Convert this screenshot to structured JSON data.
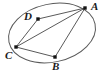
{
  "figure": {
    "kind": "geometry-diagram",
    "background_color": "#ffffff",
    "stroke_color": "#5a5a5a",
    "point_color": "#141414",
    "label_color": "#1a1a1a",
    "canvas": {
      "width": 104,
      "height": 76
    },
    "ellipse": {
      "name": "outer-ellipse",
      "cx": 52,
      "cy": 33,
      "rx": 44,
      "ry": 29,
      "rotation_deg": -12,
      "stroke_width": 1
    },
    "points": [
      {
        "id": "A",
        "label": "A",
        "x": 85,
        "y": 8,
        "label_x": 91,
        "label_y": 1,
        "on_curve": true,
        "dot": true
      },
      {
        "id": "B",
        "label": "B",
        "x": 55,
        "y": 57,
        "label_x": 52,
        "label_y": 61,
        "on_curve": true,
        "dot": true
      },
      {
        "id": "C",
        "label": "C",
        "x": 16,
        "y": 47,
        "label_x": 5,
        "label_y": 50,
        "on_curve": true,
        "dot": true
      },
      {
        "id": "D",
        "label": "D",
        "x": 38,
        "y": 19,
        "label_x": 24,
        "label_y": 11,
        "on_curve": false,
        "dot": true
      }
    ],
    "segments": [
      {
        "id": "AD",
        "from": "A",
        "to": "D",
        "name": "segment-a-d"
      },
      {
        "id": "AC",
        "from": "A",
        "to": "C",
        "name": "segment-a-c"
      },
      {
        "id": "AB",
        "from": "A",
        "to": "B",
        "name": "segment-a-b"
      },
      {
        "id": "DC",
        "from": "D",
        "to": "C",
        "name": "segment-d-c"
      },
      {
        "id": "CB",
        "from": "C",
        "to": "B",
        "name": "segment-c-b"
      }
    ],
    "point_radius": 1.7
  }
}
